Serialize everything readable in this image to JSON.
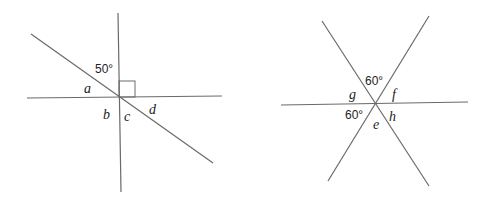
{
  "diagrams": [
    {
      "name": "left",
      "lines": [
        {
          "id": "vertical",
          "x1": 118,
          "y1": 13,
          "x2": 121,
          "y2": 192
        },
        {
          "id": "horizontal",
          "x1": 27,
          "y1": 98,
          "x2": 222,
          "y2": 96
        },
        {
          "id": "diagonal",
          "x1": 31,
          "y1": 34,
          "x2": 213,
          "y2": 163
        }
      ],
      "right_angle_marker": {
        "x": 119,
        "y": 81,
        "w": 16,
        "h": 16
      },
      "labels": {
        "angle_given": "50°",
        "a": "a",
        "b": "b",
        "c": "c",
        "d": "d"
      }
    },
    {
      "name": "right",
      "lines": [
        {
          "id": "horizontal",
          "x1": 281,
          "y1": 105,
          "x2": 468,
          "y2": 102
        },
        {
          "id": "diag-down",
          "x1": 322,
          "y1": 21,
          "x2": 429,
          "y2": 186
        },
        {
          "id": "diag-up",
          "x1": 429,
          "y1": 16,
          "x2": 328,
          "y2": 181
        }
      ],
      "labels": {
        "angle_top": "60°",
        "angle_bottom_left": "60°",
        "g": "g",
        "f": "f",
        "e": "e",
        "h": "h"
      }
    }
  ],
  "colors": {
    "line": "#6a6a6a",
    "text": "#222222",
    "background": "#ffffff"
  }
}
